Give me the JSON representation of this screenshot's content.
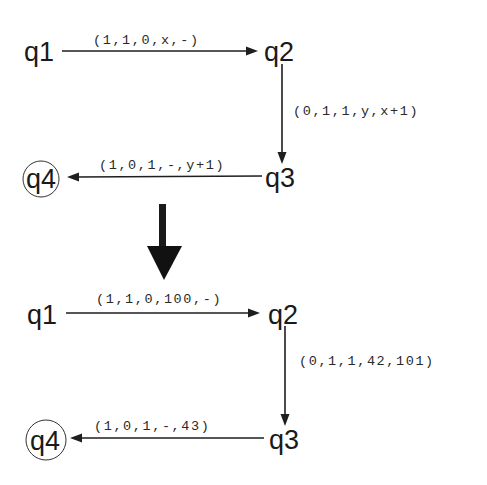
{
  "diagrams": [
    {
      "name": "symbolic",
      "states": [
        {
          "id": "q1",
          "label": "q1",
          "accepting": false
        },
        {
          "id": "q2",
          "label": "q2",
          "accepting": false
        },
        {
          "id": "q3",
          "label": "q3",
          "accepting": false
        },
        {
          "id": "q4",
          "label": "q4",
          "accepting": true
        }
      ],
      "transitions": [
        {
          "from": "q1",
          "to": "q2",
          "label": "(1,1,0,x,-)"
        },
        {
          "from": "q2",
          "to": "q3",
          "label": "(0,1,1,y,x+1)"
        },
        {
          "from": "q3",
          "to": "q4",
          "label": "(1,0,1,-,y+1)"
        }
      ]
    },
    {
      "name": "concrete",
      "states": [
        {
          "id": "q1",
          "label": "q1",
          "accepting": false
        },
        {
          "id": "q2",
          "label": "q2",
          "accepting": false
        },
        {
          "id": "q3",
          "label": "q3",
          "accepting": false
        },
        {
          "id": "q4",
          "label": "q4",
          "accepting": true
        }
      ],
      "transitions": [
        {
          "from": "q1",
          "to": "q2",
          "label": "(1,1,0,100,-)"
        },
        {
          "from": "q2",
          "to": "q3",
          "label": "(0,1,1,42,101)"
        },
        {
          "from": "q3",
          "to": "q4",
          "label": "(1,0,1,-,43)"
        }
      ]
    }
  ],
  "colors": {
    "ink": "#1e1e1e",
    "background": "#ffffff"
  }
}
